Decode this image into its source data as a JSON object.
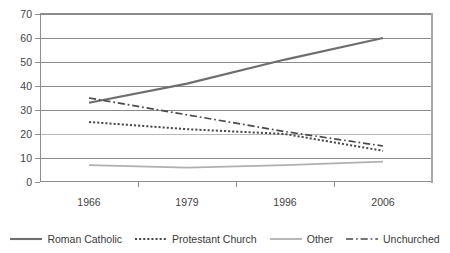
{
  "chart_data": {
    "type": "line",
    "title": "",
    "subtitle": "",
    "xlabel": "",
    "ylabel": "",
    "categories": [
      "1966",
      "1979",
      "1996",
      "2006"
    ],
    "ylim": [
      0,
      70
    ],
    "ytick_values": [
      0,
      10,
      20,
      30,
      40,
      50,
      60,
      70
    ],
    "ytick_labels": [
      "0",
      "10",
      "20",
      "30",
      "40",
      "50",
      "60",
      "70"
    ],
    "grid": true,
    "grid_axis": "y",
    "legend_position": "bottom",
    "series": [
      {
        "name": "Roman Catholic",
        "values": [
          33,
          41,
          51,
          60
        ],
        "color": "#6e6e6e",
        "style": "solid",
        "width": 2.1
      },
      {
        "name": "Protestant Church",
        "values": [
          25,
          22,
          20,
          13
        ],
        "color": "#4a4a4a",
        "style": "dotted",
        "width": 2.0
      },
      {
        "name": "Other",
        "values": [
          7,
          6,
          7,
          8.5
        ],
        "color": "#b0b0b0",
        "style": "solid",
        "width": 1.8
      },
      {
        "name": "Unchurched",
        "values": [
          35,
          28,
          21,
          15
        ],
        "color": "#4a4a4a",
        "style": "dashdot",
        "width": 1.7
      }
    ]
  },
  "legend": {
    "entries": [
      {
        "label": "Roman Catholic"
      },
      {
        "label": "Protestant Church"
      },
      {
        "label": "Other"
      },
      {
        "label": "Unchurched"
      }
    ]
  }
}
